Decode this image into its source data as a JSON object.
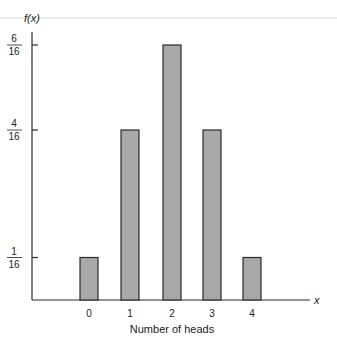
{
  "chart_data": {
    "type": "bar",
    "title": "",
    "xlabel": "Number of heads",
    "ylabel": "f(x)",
    "x_axis_symbol": "x",
    "categories": [
      "0",
      "1",
      "2",
      "3",
      "4"
    ],
    "values": [
      0.0625,
      0.25,
      0.375,
      0.25,
      0.0625
    ],
    "values_fraction": [
      "1/16",
      "4/16",
      "6/16",
      "4/16",
      "1/16"
    ],
    "y_ticks": [
      {
        "value": 0.0625,
        "numerator": "1",
        "denominator": "16"
      },
      {
        "value": 0.25,
        "numerator": "4",
        "denominator": "16"
      },
      {
        "value": 0.375,
        "numerator": "6",
        "denominator": "16"
      }
    ],
    "ylim": [
      0,
      0.375
    ],
    "grid": false,
    "legend": null,
    "colors": {
      "bar_fill": "#a9a9a9",
      "bar_stroke": "#2a2a2a",
      "axis": "#2a2a2a",
      "top_rule": "#d8d8d8"
    }
  }
}
